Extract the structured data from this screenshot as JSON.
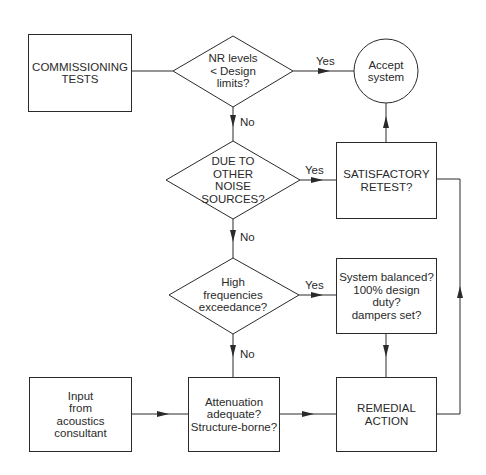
{
  "diagram": {
    "type": "flowchart",
    "nodes": {
      "commissioning": {
        "text": "COMMISSIONING\nTESTS",
        "shape": "rectangle"
      },
      "nr_levels": {
        "text": "NR levels\n< Design\nlimits?",
        "shape": "diamond"
      },
      "accept": {
        "text": "Accept\nsystem",
        "shape": "circle"
      },
      "other_noise": {
        "text": "DUE TO\nOTHER\nNOISE\nSOURCES?",
        "shape": "diamond"
      },
      "retest": {
        "text": "SATISFACTORY\nRETEST?",
        "shape": "rectangle"
      },
      "high_freq": {
        "text": "High\nfrequencies\nexceedance?",
        "shape": "diamond"
      },
      "balanced": {
        "text": "System balanced?\n100% design\nduty?\ndampers set?",
        "shape": "rectangle"
      },
      "input": {
        "text": "Input\nfrom\nacoustics\nconsultant",
        "shape": "rectangle"
      },
      "attenuation": {
        "text": "Attenuation\nadequate?\nStructure-borne?",
        "shape": "rectangle"
      },
      "remedial": {
        "text": "REMEDIAL\nACTION",
        "shape": "rectangle"
      }
    },
    "edge_labels": {
      "nr_yes": "Yes",
      "nr_no": "No",
      "other_yes": "Yes",
      "other_no": "No",
      "hf_yes": "Yes",
      "hf_no": "No"
    },
    "edges": [
      {
        "from": "commissioning",
        "to": "nr_levels"
      },
      {
        "from": "nr_levels",
        "to": "accept",
        "label": "Yes"
      },
      {
        "from": "nr_levels",
        "to": "other_noise",
        "label": "No"
      },
      {
        "from": "other_noise",
        "to": "retest",
        "label": "Yes"
      },
      {
        "from": "other_noise",
        "to": "high_freq",
        "label": "No"
      },
      {
        "from": "retest",
        "to": "accept"
      },
      {
        "from": "retest",
        "to": "remedial"
      },
      {
        "from": "high_freq",
        "to": "balanced",
        "label": "Yes"
      },
      {
        "from": "high_freq",
        "to": "attenuation",
        "label": "No"
      },
      {
        "from": "balanced",
        "to": "remedial"
      },
      {
        "from": "input",
        "to": "attenuation"
      },
      {
        "from": "attenuation",
        "to": "remedial"
      },
      {
        "from": "remedial",
        "to": "retest"
      }
    ],
    "colors": {
      "stroke": "#2a2a2a",
      "background": "#ffffff"
    }
  }
}
